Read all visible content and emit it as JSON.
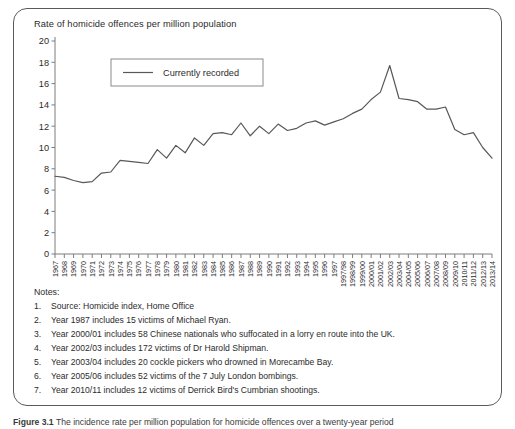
{
  "figure": {
    "caption_label": "Figure 3.1",
    "caption_text": "The incidence rate per million population for homicide offences over a twenty-year period"
  },
  "notes": {
    "heading": "Notes:",
    "items": [
      {
        "num": "1.",
        "text": "Source: Homicide index, Home Office"
      },
      {
        "num": "2.",
        "text": "Year 1987 includes 15 victims of Michael Ryan."
      },
      {
        "num": "3.",
        "text": "Year 2000/01 includes 58 Chinese nationals who suffocated in a lorry en route into the UK."
      },
      {
        "num": "4.",
        "text": "Year 2002/03 includes 172 victims of Dr Harold Shipman."
      },
      {
        "num": "5.",
        "text": "Year 2003/04 includes 20 cockle pickers who drowned in Morecambe Bay."
      },
      {
        "num": "6.",
        "text": "Year 2005/06 includes 52 victims of the 7 July London bombings."
      },
      {
        "num": "7.",
        "text": "Year 2010/11 includes 12 victims of Derrick Bird's Cumbrian shootings."
      }
    ]
  },
  "chart_data": {
    "type": "line",
    "title": "Rate of homicide offences per million population",
    "xlabel": "",
    "ylabel": "Rate of homicide offences per million population",
    "ylim": [
      0,
      20
    ],
    "yticks": [
      0,
      2,
      4,
      6,
      8,
      10,
      12,
      14,
      16,
      18,
      20
    ],
    "grid": false,
    "legend_position": "top-left",
    "line_color": "#58585a",
    "categories": [
      "1967",
      "1968",
      "1969",
      "1970",
      "1971",
      "1972",
      "1973",
      "1974",
      "1975",
      "1976",
      "1977",
      "1978",
      "1979",
      "1980",
      "1981",
      "1982",
      "1983",
      "1984",
      "1985",
      "1986",
      "1987",
      "1988",
      "1989",
      "1990",
      "1991",
      "1992",
      "1993",
      "1994",
      "1995",
      "1996",
      "1997",
      "1997/98",
      "1998/99",
      "1999/00",
      "2000/01",
      "2001/02",
      "2002/03",
      "2003/04",
      "2004/05",
      "2005/06",
      "2006/07",
      "2007/08",
      "2008/09",
      "2009/10",
      "2010/11",
      "2011/12",
      "2012/13",
      "2013/14"
    ],
    "series": [
      {
        "name": "Currently recorded",
        "values": [
          7.3,
          7.2,
          6.9,
          6.7,
          6.8,
          7.6,
          7.7,
          8.8,
          8.7,
          8.6,
          8.5,
          9.8,
          9.0,
          10.2,
          9.5,
          10.9,
          10.2,
          11.3,
          11.4,
          11.2,
          12.3,
          11.1,
          12.0,
          11.3,
          12.2,
          11.6,
          11.8,
          12.3,
          12.5,
          12.1,
          12.4,
          12.7,
          13.2,
          13.6,
          14.5,
          15.2,
          17.7,
          14.6,
          14.5,
          14.3,
          13.6,
          13.6,
          13.8,
          11.7,
          11.2,
          11.4,
          10.0,
          9.0
        ]
      }
    ],
    "legend": [
      {
        "label": "Currently recorded"
      }
    ]
  }
}
